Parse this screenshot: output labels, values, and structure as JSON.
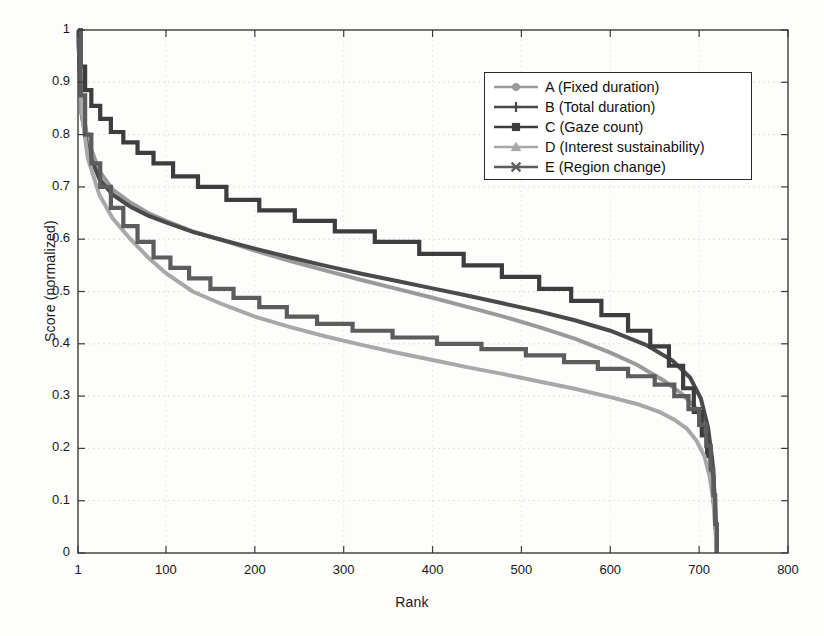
{
  "chart_data": {
    "type": "line",
    "title": "",
    "xlabel": "Rank",
    "ylabel": "Score (normalized)",
    "xlim": [
      1,
      800
    ],
    "ylim": [
      0,
      1
    ],
    "grid": true,
    "legend_position": "upper-right",
    "xticks": [
      "1",
      "100",
      "200",
      "300",
      "400",
      "500",
      "600",
      "700",
      "800"
    ],
    "xtick_values": [
      1,
      100,
      200,
      300,
      400,
      500,
      600,
      700,
      800
    ],
    "yticks": [
      "0",
      "0.1",
      "0.2",
      "0.3",
      "0.4",
      "0.5",
      "0.6",
      "0.7",
      "0.8",
      "0.9",
      "1"
    ],
    "ytick_values": [
      0,
      0.1,
      0.2,
      0.3,
      0.4,
      0.5,
      0.6,
      0.7,
      0.8,
      0.9,
      1
    ],
    "series": [
      {
        "name": "A (Fixed duration)",
        "key": "A",
        "marker": "circle",
        "color": "#9a9a9a",
        "x": [
          1,
          5,
          12,
          25,
          40,
          60,
          80,
          100,
          130,
          160,
          200,
          240,
          280,
          320,
          360,
          400,
          440,
          480,
          520,
          560,
          600,
          630,
          660,
          680,
          695,
          705,
          712,
          716,
          718,
          720
        ],
        "y": [
          1.0,
          0.86,
          0.79,
          0.73,
          0.695,
          0.67,
          0.65,
          0.635,
          0.615,
          0.6,
          0.578,
          0.558,
          0.54,
          0.522,
          0.505,
          0.488,
          0.47,
          0.452,
          0.432,
          0.41,
          0.383,
          0.36,
          0.33,
          0.305,
          0.28,
          0.25,
          0.205,
          0.15,
          0.08,
          0.0
        ]
      },
      {
        "name": "B (Total duration)",
        "key": "B",
        "marker": "plus",
        "color": "#4a4a4a",
        "x": [
          1,
          5,
          12,
          25,
          40,
          60,
          80,
          100,
          130,
          160,
          200,
          240,
          280,
          320,
          360,
          400,
          440,
          480,
          520,
          560,
          600,
          640,
          670,
          690,
          702,
          710,
          715,
          718,
          720
        ],
        "y": [
          1.0,
          0.84,
          0.77,
          0.715,
          0.685,
          0.662,
          0.645,
          0.632,
          0.614,
          0.6,
          0.582,
          0.565,
          0.549,
          0.534,
          0.52,
          0.506,
          0.492,
          0.477,
          0.462,
          0.445,
          0.425,
          0.398,
          0.368,
          0.335,
          0.295,
          0.24,
          0.175,
          0.09,
          0.0
        ]
      },
      {
        "name": "C (Gaze count)",
        "key": "C",
        "marker": "square",
        "color": "#3d3d3d",
        "step": true,
        "x": [
          1,
          4,
          9,
          16,
          26,
          38,
          52,
          68,
          86,
          108,
          136,
          168,
          205,
          245,
          290,
          335,
          385,
          435,
          478,
          520,
          556,
          590,
          620,
          645,
          666,
          682,
          694,
          703,
          709,
          713,
          716,
          718,
          720
        ],
        "y": [
          1.0,
          0.93,
          0.885,
          0.855,
          0.83,
          0.805,
          0.785,
          0.765,
          0.745,
          0.72,
          0.7,
          0.675,
          0.655,
          0.635,
          0.615,
          0.595,
          0.572,
          0.55,
          0.528,
          0.505,
          0.482,
          0.455,
          0.425,
          0.395,
          0.358,
          0.315,
          0.27,
          0.225,
          0.185,
          0.145,
          0.1,
          0.05,
          0.0
        ]
      },
      {
        "name": "D (Interest sustainability)",
        "key": "D",
        "marker": "triangle",
        "color": "#a8a8a8",
        "x": [
          1,
          5,
          12,
          25,
          40,
          60,
          80,
          100,
          130,
          160,
          200,
          240,
          280,
          320,
          360,
          400,
          440,
          480,
          520,
          560,
          600,
          630,
          655,
          672,
          686,
          697,
          706,
          712,
          716,
          718,
          720
        ],
        "y": [
          1.0,
          0.845,
          0.755,
          0.685,
          0.64,
          0.6,
          0.565,
          0.535,
          0.5,
          0.478,
          0.452,
          0.432,
          0.414,
          0.398,
          0.383,
          0.369,
          0.355,
          0.342,
          0.328,
          0.314,
          0.298,
          0.285,
          0.27,
          0.255,
          0.238,
          0.215,
          0.185,
          0.145,
          0.1,
          0.05,
          0.0
        ]
      },
      {
        "name": "E (Region change)",
        "key": "E",
        "marker": "cross",
        "color": "#5c5c5c",
        "step": true,
        "x": [
          1,
          4,
          9,
          16,
          26,
          38,
          52,
          68,
          86,
          105,
          126,
          150,
          176,
          205,
          236,
          270,
          310,
          355,
          405,
          455,
          505,
          548,
          586,
          620,
          650,
          672,
          688,
          700,
          708,
          713,
          716,
          718,
          720
        ],
        "y": [
          1.0,
          0.875,
          0.8,
          0.745,
          0.7,
          0.66,
          0.625,
          0.595,
          0.565,
          0.545,
          0.525,
          0.505,
          0.488,
          0.47,
          0.452,
          0.438,
          0.425,
          0.412,
          0.4,
          0.39,
          0.378,
          0.365,
          0.352,
          0.338,
          0.322,
          0.3,
          0.275,
          0.245,
          0.205,
          0.16,
          0.11,
          0.055,
          0.0
        ]
      }
    ]
  },
  "legend": {
    "items": [
      {
        "label": "A (Fixed duration)",
        "marker": "circle-marker",
        "color": "#9a9a9a"
      },
      {
        "label": "B (Total duration)",
        "marker": "plus-marker",
        "color": "#4a4a4a"
      },
      {
        "label": "C (Gaze count)",
        "marker": "square-marker",
        "color": "#3d3d3d"
      },
      {
        "label": "D (Interest sustainability)",
        "marker": "triangle-marker",
        "color": "#a8a8a8"
      },
      {
        "label": "E (Region change)",
        "marker": "cross-marker",
        "color": "#5c5c5c"
      }
    ]
  },
  "axes": {
    "x_title": "Rank",
    "y_title": "Score (normalized)"
  }
}
